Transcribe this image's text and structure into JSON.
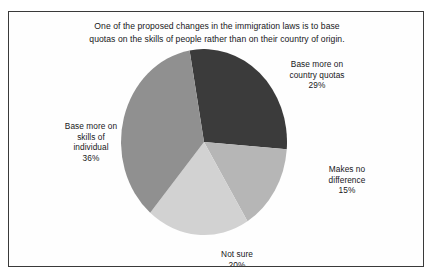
{
  "figure": {
    "title_line_1": "One of the proposed changes in the immigration laws is to base",
    "title_line_2": "quotas on the skills of people rather than on their country of origin.",
    "frame_color": "#3a3a3a",
    "background_color": "#fefefe"
  },
  "labels": {
    "country_quotas": {
      "line_1": "Base more on",
      "line_2": "country quotas",
      "value": "29%"
    },
    "makes_no_difference": {
      "line_1": "Makes no",
      "line_2": "difference",
      "value": "15%"
    },
    "not_sure": {
      "line_1": "Not sure",
      "value": "20%"
    },
    "skills_individual": {
      "line_1": "Base more on",
      "line_2": "skills of",
      "line_3": "individual",
      "value": "36%"
    }
  },
  "chart_data": {
    "type": "pie",
    "title": "One of the proposed changes in the immigration laws is to base quotas on the skills of people rather than on their country of origin.",
    "categories": [
      "Base more on country quotas",
      "Makes no difference",
      "Not sure",
      "Base more on skills of individual"
    ],
    "values": [
      29,
      15,
      20,
      36
    ],
    "unit": "percent",
    "total": 100,
    "colors": [
      "#3b3b3b",
      "#b6b6b6",
      "#d2d2d2",
      "#909090"
    ],
    "start_angle_deg": -10,
    "direction": "clockwise",
    "legend": "none",
    "labels_position": "outside",
    "grid": false
  }
}
